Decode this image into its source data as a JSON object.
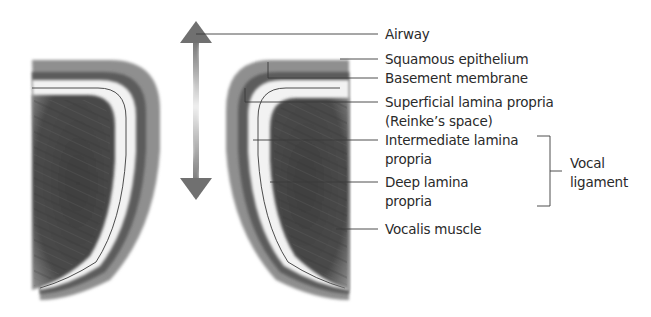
{
  "figure": {
    "colors": {
      "muscle": "#474747",
      "outer_layer": "#8a8a8a",
      "dark_band": "#5a5a5a",
      "lamina_light": "#f2f2f2",
      "leader_line": "#3a3a3a",
      "text": "#2a2a2a",
      "arrow_dark": "#7a7a7a",
      "arrow_light": "#e8e8e8"
    }
  },
  "arrow": {
    "icon": "double-headed-wavy-arrow",
    "meaning": "airway airflow direction"
  },
  "labels": {
    "airway": "Airway",
    "squamous_epithelium": "Squamous epithelium",
    "basement_membrane": "Basement membrane",
    "superficial_lamina_propria_line1": "Superficial lamina propria",
    "superficial_lamina_propria_line2": "(Reinke’s space)",
    "intermediate_lamina_propria_line1": "Intermediate lamina",
    "intermediate_lamina_propria_line2": "propria",
    "deep_lamina_propria_line1": "Deep lamina",
    "deep_lamina_propria_line2": "propria",
    "vocal_ligament_line1": "Vocal",
    "vocal_ligament_line2": "ligament",
    "vocalis_muscle": "Vocalis muscle"
  }
}
